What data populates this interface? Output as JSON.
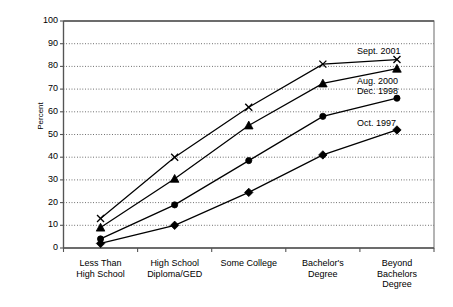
{
  "chart_data": {
    "type": "line",
    "title": "",
    "xlabel": "",
    "ylabel": "Percent",
    "ylim": [
      0,
      100
    ],
    "ytick_labels": [
      "0",
      "10",
      "20",
      "30",
      "40",
      "50",
      "60",
      "70",
      "80",
      "90",
      "100"
    ],
    "yticks": [
      0,
      10,
      20,
      30,
      40,
      50,
      60,
      70,
      80,
      90,
      100
    ],
    "grid": "horizontal-dotted",
    "legend_position": "inline-annotations-right",
    "categories": [
      "Less Than\nHigh School",
      "High School\nDiploma/GED",
      "Some College",
      "Bachelor's\nDegree",
      "Beyond\nBachelors\nDegree"
    ],
    "category_lines": [
      [
        "Less Than",
        "High School"
      ],
      [
        "High School",
        "Diploma/GED"
      ],
      [
        "Some College"
      ],
      [
        "Bachelor's",
        "Degree"
      ],
      [
        "Beyond",
        "Bachelors",
        "Degree"
      ]
    ],
    "series": [
      {
        "name": "Sept. 2001",
        "marker": "x",
        "values": [
          13,
          40,
          62,
          81,
          83
        ]
      },
      {
        "name": "Aug. 2000",
        "marker": "triangle",
        "values": [
          9,
          30.5,
          54,
          72.5,
          79
        ]
      },
      {
        "name": "Dec. 1998",
        "marker": "circle",
        "values": [
          4,
          19,
          38.5,
          58,
          66
        ]
      },
      {
        "name": "Oct. 1997",
        "marker": "diamond",
        "values": [
          2,
          10,
          24.5,
          41,
          52
        ]
      }
    ],
    "annotations": [
      {
        "text": "Sept. 2001",
        "value": 83
      },
      {
        "text": "Aug. 2000",
        "value": 79
      },
      {
        "text": "Dec. 1998",
        "value": 66
      },
      {
        "text": "Oct. 1997",
        "value": 52
      }
    ]
  },
  "colors": {
    "line": "#000000",
    "marker": "#000000",
    "grid": "#000000",
    "axis": "#555555",
    "background": "#ffffff"
  }
}
